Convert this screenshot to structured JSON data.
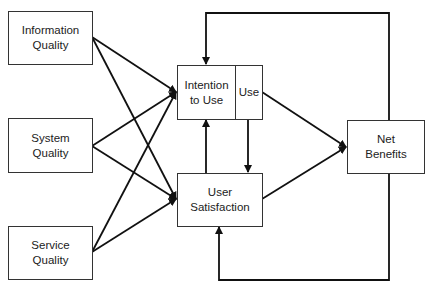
{
  "diagram": {
    "title": "",
    "nodes": {
      "information_quality": {
        "line1": "Information",
        "line2": "Quality"
      },
      "system_quality": {
        "line1": "System",
        "line2": "Quality"
      },
      "service_quality": {
        "line1": "Service",
        "line2": "Quality"
      },
      "intention_to_use": {
        "line1": "Intention",
        "line2": "to Use"
      },
      "use": {
        "label": "Use"
      },
      "user_satisfaction": {
        "line1": "User",
        "line2": "Satisfaction"
      },
      "net_benefits": {
        "line1": "Net",
        "line2": "Benefits"
      }
    },
    "edges": [
      {
        "from": "Information Quality",
        "to": "Intention to Use / Use"
      },
      {
        "from": "Information Quality",
        "to": "User Satisfaction"
      },
      {
        "from": "System Quality",
        "to": "Intention to Use / Use"
      },
      {
        "from": "System Quality",
        "to": "User Satisfaction"
      },
      {
        "from": "Service Quality",
        "to": "Intention to Use / Use"
      },
      {
        "from": "Service Quality",
        "to": "User Satisfaction"
      },
      {
        "from": "User Satisfaction",
        "to": "Intention to Use"
      },
      {
        "from": "Use",
        "to": "User Satisfaction"
      },
      {
        "from": "Use",
        "to": "Net Benefits"
      },
      {
        "from": "User Satisfaction",
        "to": "Net Benefits"
      },
      {
        "from": "Net Benefits",
        "to": "Intention to Use",
        "type": "feedback"
      },
      {
        "from": "Net Benefits",
        "to": "User Satisfaction",
        "type": "feedback"
      }
    ]
  }
}
